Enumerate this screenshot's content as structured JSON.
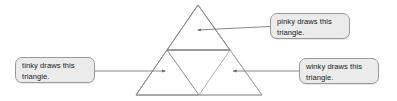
{
  "figure": {
    "background_color": "#ffffff",
    "callout_fill": "#ebebeb",
    "callout_border": "#9a9a9a",
    "line_color": "#808080",
    "triangle_stroke": "#8a8a8a"
  },
  "callouts": [
    {
      "id": "pinky",
      "line1": "pinky draws this",
      "line2": "triangle.",
      "target": "top-sub-triangle"
    },
    {
      "id": "tinky",
      "line1": "tinky draws this",
      "line2": "triangle.",
      "target": "bottom-left-sub-triangle"
    },
    {
      "id": "winky",
      "line1": "winky draws this",
      "line2": "triangle.",
      "target": "bottom-right-sub-triangle"
    }
  ],
  "shape": {
    "type": "subdivided-triangle",
    "outer": {
      "apex": [
        198,
        5
      ],
      "left": [
        136,
        95
      ],
      "right": [
        262,
        95
      ]
    },
    "midpoints": {
      "left_mid": [
        167,
        50
      ],
      "right_mid": [
        230,
        50
      ],
      "base_mid": [
        199,
        95
      ]
    },
    "sub_triangles": [
      "top",
      "bottom-left",
      "bottom-right",
      "center-inverted"
    ]
  },
  "leaders": [
    {
      "id": "pinky-leader",
      "from": [
        270,
        26
      ],
      "to": [
        196,
        30
      ],
      "arrow_at": "to"
    },
    {
      "id": "tinky-leader",
      "from": [
        95,
        71
      ],
      "to": [
        166,
        71
      ],
      "arrow_at": "to"
    },
    {
      "id": "winky-leader",
      "from": [
        299,
        71
      ],
      "to": [
        232,
        71
      ],
      "arrow_at": "to"
    }
  ]
}
